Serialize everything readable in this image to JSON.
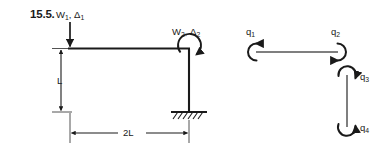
{
  "figure": {
    "problem_number": "15.5.",
    "type": "structural-frame-diagram",
    "stroke_color": "#1a1a1a",
    "background_color": "#ffffff"
  },
  "frame_diagram": {
    "loads": [
      {
        "name": "vertical-point-load",
        "base": "W",
        "base_sub": "1",
        "second": "Δ",
        "second_sub": "1",
        "separator": ", ",
        "direction": "downward"
      },
      {
        "name": "applied-moment",
        "base": "W",
        "base_sub": "2",
        "second": "Δ",
        "second_sub": "2",
        "separator": ", ",
        "direction": "clockwise-moment"
      }
    ],
    "dimensions": [
      {
        "name": "column-height",
        "label": "L",
        "orientation": "vertical"
      },
      {
        "name": "beam-span",
        "label": "2L",
        "orientation": "horizontal"
      }
    ],
    "support": {
      "name": "fixed-support",
      "label": "",
      "type": "fixed-hatched"
    }
  },
  "dof_diagram": {
    "title": "",
    "dofs": [
      {
        "base": "q",
        "sub": "1",
        "position": "beam-left-end",
        "sense": "rotation"
      },
      {
        "base": "q",
        "sub": "2",
        "position": "beam-right-end",
        "sense": "rotation"
      },
      {
        "base": "q",
        "sub": "3",
        "position": "column-top",
        "sense": "rotation"
      },
      {
        "base": "q",
        "sub": "4",
        "position": "column-bottom",
        "sense": "rotation"
      }
    ]
  }
}
